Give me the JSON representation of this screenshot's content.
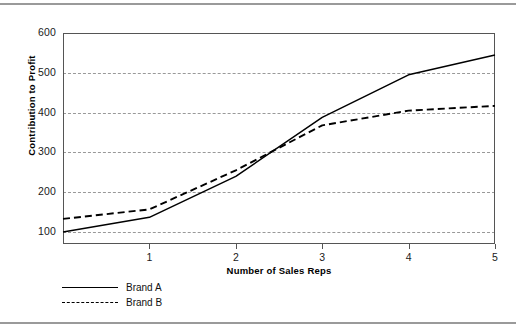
{
  "chart_data": {
    "type": "line",
    "title": "",
    "xlabel": "Number of Sales Reps",
    "ylabel": "Contribution to Profit",
    "x": [
      0,
      1,
      2,
      3,
      4,
      5
    ],
    "xlim": [
      0,
      5
    ],
    "ylim": [
      70,
      600
    ],
    "xticks": [
      "1",
      "2",
      "3",
      "4",
      "5"
    ],
    "xtick_values": [
      1,
      2,
      3,
      4,
      5
    ],
    "yticks": [
      "100",
      "200",
      "300",
      "400",
      "500",
      "600"
    ],
    "ytick_values": [
      100,
      200,
      300,
      400,
      500,
      600
    ],
    "grid": "horizontal-dashed",
    "gridline_values": [
      100,
      200,
      300,
      400,
      500
    ],
    "legend_position": "below-left",
    "series": [
      {
        "name": "Brand A",
        "style": "solid",
        "color": "#000000",
        "values": [
          100,
          137,
          240,
          388,
          495,
          545
        ]
      },
      {
        "name": "Brand B",
        "style": "dashed",
        "color": "#000000",
        "values": [
          133,
          157,
          255,
          368,
          405,
          417
        ]
      }
    ]
  },
  "axes": {
    "y_title": "Contribution to Profit",
    "x_title": "Number of Sales Reps"
  },
  "legend": {
    "entries": [
      {
        "label": "Brand A"
      },
      {
        "label": "Brand B"
      }
    ]
  },
  "colors": {
    "series_line": "#000000",
    "gridline": "#999999",
    "frame": "#555555",
    "page_rule": "#9a9a9a",
    "background": "#ffffff"
  }
}
